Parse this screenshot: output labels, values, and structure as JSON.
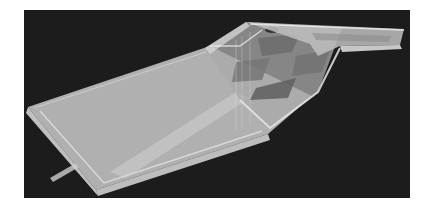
{
  "scene": {
    "description": "Translucent gray 3D model of a slab/walkway with a raised ramp and a right-hand arm, on a dark background",
    "background_color": "#1c1c1c",
    "model_color": "#c8c8c8",
    "edge_color": "#e6e6e6",
    "hole_color": "#6a6a6a"
  }
}
